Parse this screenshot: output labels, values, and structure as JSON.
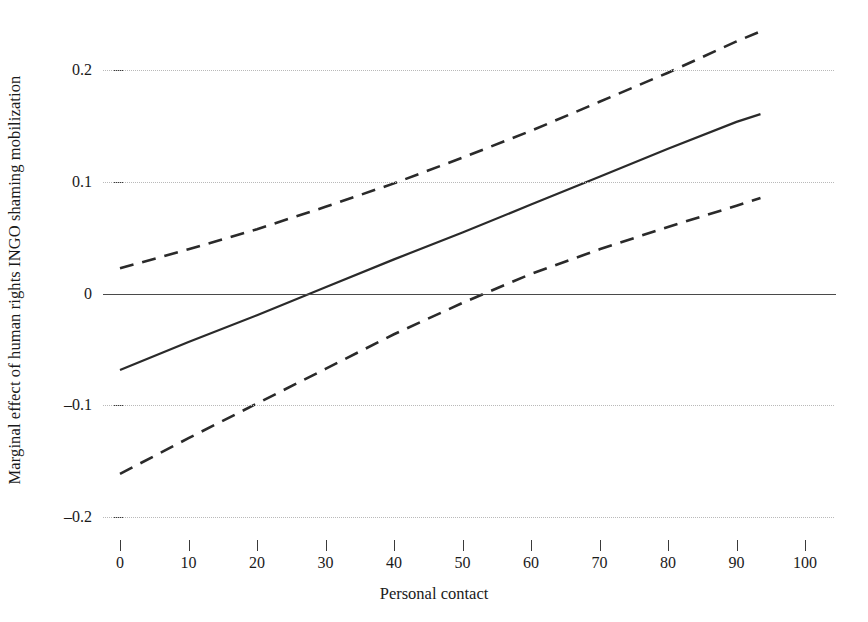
{
  "chart_data": {
    "type": "line",
    "title": "",
    "xlabel": "Personal contact",
    "ylabel": "Marginal effect of human rights INGO shaming mobilization",
    "xlim": [
      0,
      100
    ],
    "ylim": [
      -0.2,
      0.25
    ],
    "xticks": [
      "0",
      "10",
      "20",
      "30",
      "40",
      "50",
      "60",
      "70",
      "80",
      "90",
      "100"
    ],
    "xtick_values": [
      0,
      10,
      20,
      30,
      40,
      50,
      60,
      70,
      80,
      90,
      100
    ],
    "yticks": [
      "0.2",
      "0.1",
      "0",
      "–0.1",
      "–0.2"
    ],
    "ytick_values": [
      0.2,
      0.1,
      0,
      -0.1,
      -0.2
    ],
    "grid": "horizontal-dotted",
    "legend": "none",
    "zero_reference_line": 0,
    "series": [
      {
        "name": "Marginal effect",
        "style": "solid",
        "color": "#2a2a2a",
        "x": [
          0,
          10,
          20,
          30,
          40,
          50,
          60,
          70,
          80,
          90,
          93.5
        ],
        "values": [
          -0.068,
          -0.043,
          -0.019,
          0.006,
          0.031,
          0.055,
          0.08,
          0.105,
          0.13,
          0.154,
          0.161
        ]
      },
      {
        "name": "Upper 95% confidence bound",
        "style": "dashed",
        "color": "#2a2a2a",
        "x": [
          0,
          10,
          20,
          30,
          40,
          50,
          60,
          70,
          80,
          90,
          93.5
        ],
        "values": [
          0.023,
          0.04,
          0.058,
          0.078,
          0.099,
          0.122,
          0.146,
          0.172,
          0.198,
          0.226,
          0.235
        ]
      },
      {
        "name": "Lower 95% confidence bound",
        "style": "dashed",
        "color": "#2a2a2a",
        "x": [
          0,
          10,
          20,
          30,
          40,
          50,
          60,
          70,
          80,
          90,
          93.5
        ],
        "values": [
          -0.161,
          -0.129,
          -0.098,
          -0.067,
          -0.036,
          -0.008,
          0.018,
          0.04,
          0.06,
          0.079,
          0.086
        ]
      }
    ],
    "annotations": [
      {
        "note": "Solid marginal-effect line crosses zero at approximately x = 29"
      },
      {
        "note": "Lower confidence bound crosses zero at approximately x = 45"
      },
      {
        "note": "Upper confidence bound crosses 0.2 at approximately x = 86"
      }
    ]
  }
}
